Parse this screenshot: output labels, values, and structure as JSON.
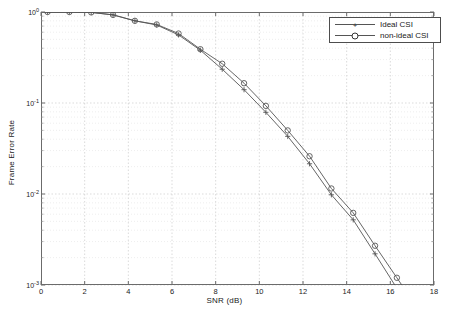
{
  "chart_data": {
    "type": "line",
    "title": "",
    "xlabel": "SNR (dB)",
    "ylabel": "Frame Error Rate",
    "yscale": "log",
    "xlim": [
      0,
      18
    ],
    "ylim": [
      0.001,
      1
    ],
    "grid": true,
    "legend_position": "top-right",
    "xticks": [
      "0",
      "2",
      "4",
      "6",
      "8",
      "10",
      "12",
      "14",
      "16",
      "18"
    ],
    "xtick_values": [
      0,
      2,
      4,
      6,
      8,
      10,
      12,
      14,
      16,
      18
    ],
    "yticks": [
      "10",
      "10",
      "10",
      "10"
    ],
    "ytick_exponents": [
      "0",
      "-1",
      "-2",
      "-3"
    ],
    "ytick_values": [
      1,
      0.1,
      0.01,
      0.001
    ],
    "series": [
      {
        "name": "Ideal CSI",
        "marker": "plus",
        "color": "#555555",
        "x": [
          0.3,
          1.3,
          2.3,
          3.3,
          4.3,
          5.3,
          6.3,
          7.3,
          8.3,
          9.3,
          10.3,
          11.3,
          12.3,
          13.3,
          14.3,
          15.3,
          16.3
        ],
        "y": [
          1.0,
          1.0,
          0.99,
          0.93,
          0.8,
          0.72,
          0.56,
          0.38,
          0.235,
          0.14,
          0.079,
          0.043,
          0.0215,
          0.0098,
          0.0052,
          0.0022,
          0.00092
        ]
      },
      {
        "name": "non-ideal CSI",
        "marker": "circle",
        "color": "#555555",
        "x": [
          0.3,
          1.3,
          2.3,
          3.3,
          4.3,
          5.3,
          6.3,
          7.3,
          8.3,
          9.3,
          10.3,
          11.3,
          12.3,
          13.3,
          14.3,
          15.3,
          16.3
        ],
        "y": [
          1.0,
          1.0,
          0.99,
          0.93,
          0.8,
          0.73,
          0.58,
          0.39,
          0.27,
          0.165,
          0.093,
          0.05,
          0.026,
          0.0115,
          0.0062,
          0.0027,
          0.0012
        ]
      }
    ]
  },
  "legend": {
    "entries": [
      {
        "label": "Ideal CSI"
      },
      {
        "label": "non-ideal CSI"
      }
    ]
  }
}
